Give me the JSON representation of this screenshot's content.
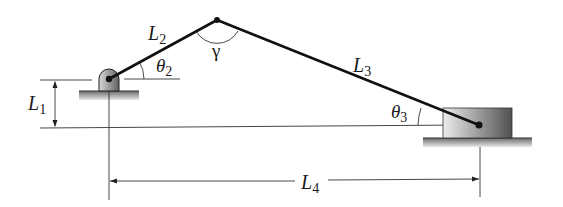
{
  "diagram": {
    "type": "slider-crank mechanism",
    "labels": {
      "L1": {
        "base": "L",
        "sub": "1"
      },
      "L2": {
        "base": "L",
        "sub": "2"
      },
      "L3": {
        "base": "L",
        "sub": "3"
      },
      "L4": {
        "base": "L",
        "sub": "4"
      },
      "theta2": {
        "base": "θ",
        "sub": "2"
      },
      "theta3": {
        "base": "θ",
        "sub": "3"
      },
      "gamma": {
        "base": "γ"
      }
    },
    "points": {
      "crank_pivot": [
        109,
        79
      ],
      "crank_rod_joint": [
        217,
        20
      ],
      "slider_pin": [
        479,
        125
      ]
    },
    "colors": {
      "link": "#111111",
      "line": "#333333",
      "block_dark": "#555555",
      "block_light": "#e6e6e6"
    }
  }
}
